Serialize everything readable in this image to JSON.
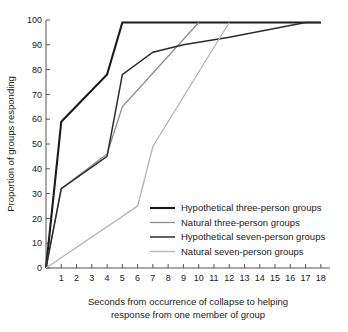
{
  "chart_data": {
    "type": "line",
    "title": "",
    "xlabel": "Seconds from occurrence of collapse to helping response from one member of group",
    "xlabel_lines": [
      "Seconds from occurrence of collapse to helping",
      "response from one member of group"
    ],
    "ylabel": "Proportion of groups responding",
    "xlim": [
      0,
      18.6
    ],
    "ylim": [
      0,
      100
    ],
    "grid": false,
    "legend_position": "center-right",
    "xticks": [
      1,
      2,
      3,
      4,
      5,
      6,
      7,
      8,
      9,
      10,
      11,
      12,
      13,
      14,
      15,
      16,
      17,
      18
    ],
    "xtick_labels": [
      "1",
      "2",
      "3",
      "4",
      "5",
      "6",
      "7",
      "8",
      "9",
      "10",
      "11",
      "12",
      "13",
      "14",
      "15",
      "16",
      "17",
      "18"
    ],
    "yticks": [
      0,
      10,
      20,
      30,
      40,
      50,
      60,
      70,
      80,
      90,
      100
    ],
    "ytick_labels": [
      "0",
      "10",
      "20",
      "30",
      "40",
      "50",
      "60",
      "70",
      "80",
      "90",
      "100"
    ],
    "series": [
      {
        "name": "Hypothetical three-person groups",
        "color": "#1a1a1a",
        "width": 2.1,
        "x": [
          0,
          1,
          4,
          5,
          18
        ],
        "values": [
          0,
          59,
          78,
          99,
          99
        ]
      },
      {
        "name": "Natural three-person groups",
        "color": "#8c8c8c",
        "width": 1.3,
        "x": [
          0,
          1,
          4,
          5,
          10
        ],
        "values": [
          0,
          32,
          46,
          65,
          99
        ]
      },
      {
        "name": "Hypothetical seven-person groups",
        "color": "#2b2b2b",
        "width": 1.5,
        "x": [
          0,
          1,
          4,
          5,
          7,
          9,
          12,
          17,
          18
        ],
        "values": [
          0,
          32,
          45,
          78,
          87,
          90,
          93,
          99,
          99
        ]
      },
      {
        "name": "Natural seven-person groups",
        "color": "#b3b3b3",
        "width": 1.3,
        "x": [
          0,
          6,
          7,
          12
        ],
        "values": [
          0,
          25,
          49,
          99
        ]
      }
    ]
  },
  "legend": {
    "items": [
      {
        "label": "Hypothetical three-person groups",
        "color": "#1a1a1a",
        "width": 2.1
      },
      {
        "label": "Natural three-person groups",
        "color": "#8c8c8c",
        "width": 1.3
      },
      {
        "label": "Hypothetical seven-person groups",
        "color": "#2b2b2b",
        "width": 1.5
      },
      {
        "label": "Natural seven-person groups",
        "color": "#b3b3b3",
        "width": 1.3
      }
    ]
  },
  "axes": {
    "y_title": "Proportion of groups responding",
    "x_title_line1": "Seconds from occurrence of collapse to helping",
    "x_title_line2": "response from one member of group"
  }
}
